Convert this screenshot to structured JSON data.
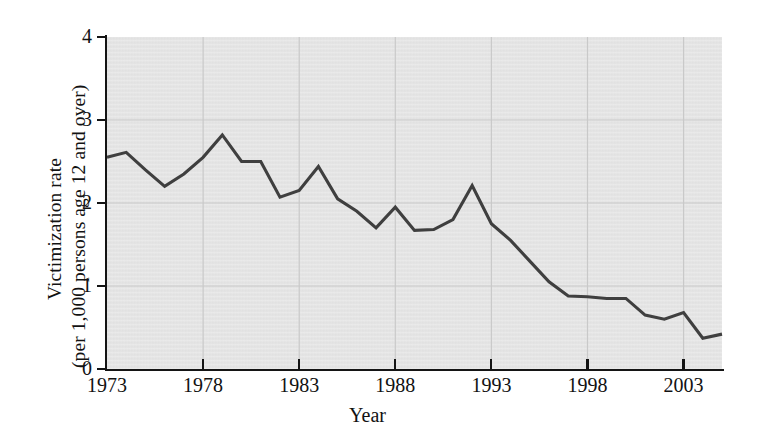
{
  "chart_data": {
    "type": "line",
    "title": "",
    "xlabel": "Year",
    "ylabel": "Victimization rate (per 1,000 persons age 12 and over)",
    "ylabel_line1": "Victimization rate",
    "ylabel_line2": "(per 1,000 persons age 12 and over)",
    "xlim": [
      1973,
      2005
    ],
    "ylim": [
      0,
      4
    ],
    "y_ticks": [
      0,
      1,
      2,
      3,
      4
    ],
    "y_tick_labels": [
      "0",
      "1",
      "2",
      "3",
      "4"
    ],
    "x_ticks": [
      1973,
      1978,
      1983,
      1988,
      1993,
      1998,
      2003
    ],
    "x_tick_labels": [
      "1973",
      "1978",
      "1983",
      "1988",
      "1993",
      "1998",
      "2003"
    ],
    "grid": "major horizontal and vertical gridlines, light gray on gray panel",
    "legend": "none",
    "line_color": "#3a3a3a",
    "panel_color": "#e3e3e3",
    "x": [
      1973,
      1974,
      1975,
      1976,
      1977,
      1978,
      1979,
      1980,
      1981,
      1982,
      1983,
      1984,
      1985,
      1986,
      1987,
      1988,
      1989,
      1990,
      1991,
      1992,
      1993,
      1994,
      1995,
      1996,
      1997,
      1998,
      1999,
      2000,
      2001,
      2002,
      2003,
      2004,
      2005
    ],
    "series": [
      {
        "name": "Victimization rate",
        "values": [
          2.55,
          2.61,
          2.4,
          2.2,
          2.35,
          2.55,
          2.82,
          2.5,
          2.5,
          2.07,
          2.15,
          2.44,
          2.05,
          1.9,
          1.7,
          1.95,
          1.67,
          1.68,
          1.8,
          2.21,
          1.75,
          1.55,
          1.3,
          1.05,
          0.88,
          0.87,
          0.85,
          0.85,
          0.65,
          0.6,
          0.68,
          0.37,
          0.42
        ]
      }
    ]
  },
  "axes": {
    "y_title_line1": "Victimization rate",
    "y_title_line2": "(per 1,000 persons age 12 and over)",
    "x_title": "Year"
  }
}
